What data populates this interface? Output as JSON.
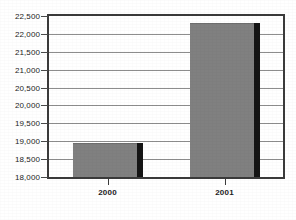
{
  "chart_data": {
    "type": "bar",
    "title": "",
    "subtitle": "",
    "xlabel": "",
    "ylabel": "",
    "categories": [
      "2000",
      "2001"
    ],
    "values": [
      18950,
      22300
    ],
    "series": [
      {
        "name": "",
        "values": [
          18950,
          22300
        ]
      }
    ],
    "ylim": [
      18000,
      22500
    ],
    "ytick_values": [
      18000,
      18500,
      19000,
      19500,
      20000,
      20500,
      21000,
      21500,
      22000,
      22500
    ],
    "ytick_labels": [
      "18,000",
      "18,500",
      "19,000",
      "19,500",
      "20,000",
      "20,500",
      "21,000",
      "21,500",
      "22,000",
      "22,500"
    ],
    "xtick_labels": [
      "2000",
      "2001"
    ],
    "grid": true,
    "grid_axis": "y",
    "legend": false,
    "legend_position": "none",
    "annotations": [],
    "colors": {
      "bar_fill": "#808080",
      "bar_shadow": "#151515",
      "gridline": "#8d8d8d",
      "axis": "#3b3b3b",
      "text": "#1c1c1c",
      "background": "#ffffff"
    }
  }
}
